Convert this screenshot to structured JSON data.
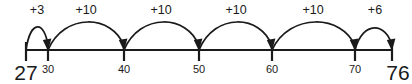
{
  "figure": {
    "line_color": "#1a1a1a",
    "background_color": "#ffffff"
  },
  "chart_data": {
    "type": "line",
    "title": "",
    "xlabel": "",
    "ylabel": "",
    "xlim": [
      27,
      76
    ],
    "grid": false,
    "legend": null,
    "categories": [
      "27",
      "30",
      "40",
      "50",
      "60",
      "70",
      "76"
    ],
    "x": [
      27,
      30,
      40,
      50,
      60,
      70,
      76
    ],
    "values": [
      27,
      30,
      40,
      50,
      60,
      70,
      76
    ],
    "ticks": [
      {
        "value": 27,
        "label": "27",
        "px": 26,
        "style": "endpoint"
      },
      {
        "value": 30,
        "label": "30",
        "px": 48,
        "style": "minor"
      },
      {
        "value": 40,
        "label": "40",
        "px": 124,
        "style": "minor"
      },
      {
        "value": 50,
        "label": "50",
        "px": 199,
        "style": "minor"
      },
      {
        "value": 60,
        "label": "60",
        "px": 272,
        "style": "minor"
      },
      {
        "value": 70,
        "label": "70",
        "px": 355,
        "style": "minor"
      },
      {
        "value": 76,
        "label": "76",
        "px": 392,
        "style": "endpoint"
      }
    ],
    "jumps": [
      {
        "label": "+3",
        "amount": 3,
        "from": 27,
        "to": 30,
        "from_px": 26,
        "to_px": 48,
        "label_px": 37,
        "peak_px": 26
      },
      {
        "label": "+10",
        "amount": 10,
        "from": 30,
        "to": 40,
        "from_px": 48,
        "to_px": 124,
        "label_px": 86,
        "peak_px": 21
      },
      {
        "label": "+10",
        "amount": 10,
        "from": 40,
        "to": 50,
        "from_px": 124,
        "to_px": 199,
        "label_px": 161,
        "peak_px": 21
      },
      {
        "label": "+10",
        "amount": 10,
        "from": 50,
        "to": 60,
        "from_px": 199,
        "to_px": 272,
        "label_px": 236,
        "peak_px": 21
      },
      {
        "label": "+10",
        "amount": 10,
        "from": 60,
        "to": 70,
        "from_px": 272,
        "to_px": 355,
        "label_px": 313,
        "peak_px": 21
      },
      {
        "label": "+6",
        "amount": 6,
        "from": 70,
        "to": 76,
        "from_px": 355,
        "to_px": 392,
        "label_px": 375,
        "peak_px": 27
      }
    ],
    "annotations": [
      "+3",
      "+10",
      "+10",
      "+10",
      "+10",
      "+6"
    ]
  }
}
